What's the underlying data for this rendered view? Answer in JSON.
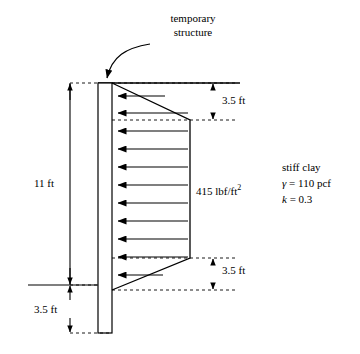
{
  "figure": {
    "title_callout": {
      "line1": "temporary",
      "line2": "structure"
    },
    "labels": {
      "top_segment": "3.5 ft",
      "pressure": "415 lbf/ft",
      "pressure_exponent": "2",
      "bottom_segment": "3.5 ft",
      "wall_height": "11 ft",
      "embedment": "3.5 ft"
    },
    "soil_box": {
      "name": "stiff clay",
      "gamma_symbol": "γ",
      "gamma_value": "= 110 pcf",
      "k_symbol": "k",
      "k_value": "= 0.3"
    }
  },
  "geometry": {
    "type": "lateral-earth-pressure-diagram",
    "wall": {
      "x": 98,
      "y_top": 83,
      "width": 14,
      "height": 250
    },
    "ground_line_y": 83,
    "excavation_line_y": 285,
    "pressure_diagram": {
      "apex_top_y": 83,
      "plateau_top_y": 120,
      "plateau_bottom_y": 258,
      "apex_bottom_y": 290,
      "max_x": 190,
      "arrow_count": 11
    }
  },
  "colors": {
    "stroke": "#000000",
    "wall_fill": "#ffffff",
    "background": "#ffffff"
  }
}
